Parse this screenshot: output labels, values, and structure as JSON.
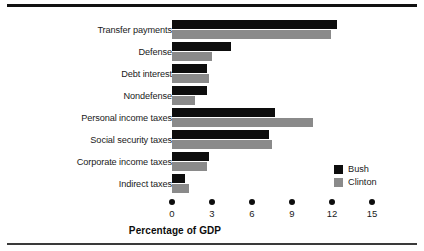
{
  "figure": {
    "background_color": "#ffffff",
    "rule_color": "#111111"
  },
  "legend": {
    "position": "inside-bottom-right",
    "items": [
      {
        "label": "Bush",
        "color": "#0d0d0d",
        "swatch_name": "legend-swatch-bush"
      },
      {
        "label": "Clinton",
        "color": "#8a8a8a",
        "swatch_name": "legend-swatch-clinton"
      }
    ]
  },
  "axis": {
    "xlabel": "Percentage of GDP",
    "ticks": [
      "0",
      "3",
      "6",
      "9",
      "12",
      "15"
    ]
  },
  "chart_data": {
    "type": "bar",
    "orientation": "horizontal",
    "title": "",
    "subtitle": "",
    "xlabel": "Percentage of GDP",
    "ylabel": "",
    "xlim": [
      0,
      15
    ],
    "xticks": [
      0,
      3,
      6,
      9,
      12,
      15
    ],
    "grid": false,
    "legend_position": "inside-bottom-right",
    "categories": [
      "Transfer payments",
      "Defense",
      "Debt interest",
      "Nondefense",
      "Personal income taxes",
      "Social security taxes",
      "Corporate income taxes",
      "Indirect taxes"
    ],
    "series": [
      {
        "name": "Bush",
        "color": "#0d0d0d",
        "values": [
          12.4,
          4.4,
          2.6,
          2.6,
          7.7,
          7.3,
          2.8,
          1.0
        ]
      },
      {
        "name": "Clinton",
        "color": "#8a8a8a",
        "values": [
          11.9,
          3.0,
          2.8,
          1.7,
          10.6,
          7.5,
          2.6,
          1.3
        ]
      }
    ]
  }
}
